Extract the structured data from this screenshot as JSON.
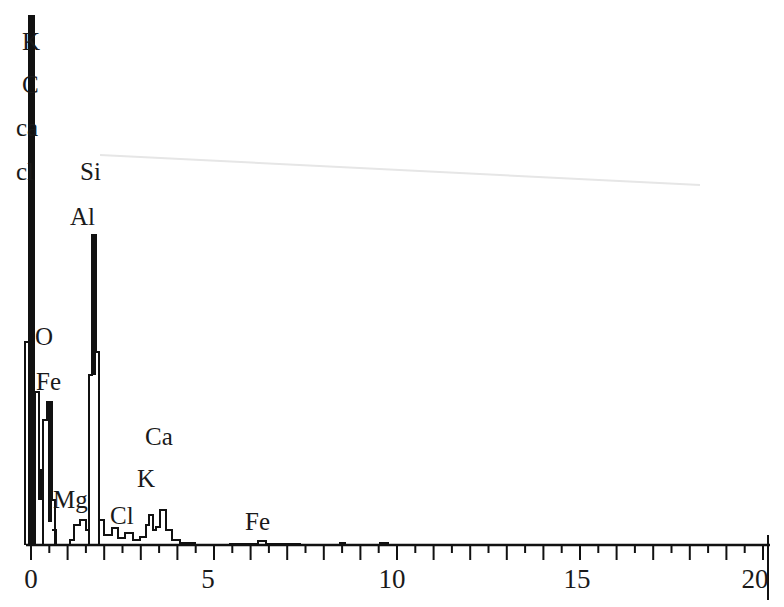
{
  "chart_data": {
    "type": "line",
    "title": "",
    "xlabel": "",
    "ylabel": "",
    "xlim": [
      0,
      20
    ],
    "x_ticks": [
      "0",
      "5",
      "10",
      "15",
      "20"
    ],
    "minor_tick_step": 0.5,
    "grid": false,
    "legend": null,
    "series": [
      {
        "name": "EDS spectrum",
        "x": [
          0.0,
          0.05,
          0.1,
          0.2,
          0.3,
          0.4,
          0.5,
          0.55,
          0.6,
          0.7,
          0.8,
          0.9,
          1.0,
          1.1,
          1.2,
          1.25,
          1.3,
          1.4,
          1.5,
          1.6,
          1.65,
          1.7,
          1.74,
          1.8,
          1.85,
          1.9,
          2.0,
          2.1,
          2.2,
          2.3,
          2.4,
          2.5,
          2.6,
          2.7,
          2.8,
          2.9,
          3.0,
          3.1,
          3.2,
          3.3,
          3.35,
          3.4,
          3.5,
          3.6,
          3.7,
          3.75,
          3.8,
          3.9,
          4.0,
          4.2,
          4.5,
          5.0,
          5.5,
          6.0,
          6.4,
          6.6,
          7.0,
          7.5,
          8.0,
          9.0,
          9.7,
          10.0,
          12.0,
          15.0,
          20.0
        ],
        "values": [
          38,
          100,
          36,
          14,
          8,
          22,
          28,
          30,
          8,
          3,
          3,
          4,
          3,
          3,
          6,
          6,
          4,
          6,
          4,
          48,
          52,
          58,
          60,
          36,
          30,
          8,
          3,
          3,
          2,
          3,
          2,
          2,
          3,
          1,
          2,
          2,
          2,
          1,
          3,
          7,
          8,
          5,
          3,
          4,
          7,
          8,
          5,
          3,
          2,
          1,
          1,
          0.6,
          0.5,
          0.5,
          0.8,
          0.5,
          0.4,
          0.4,
          0.3,
          0.2,
          0.4,
          0.2,
          0.1,
          0.1,
          0.1
        ]
      }
    ],
    "annotations": [
      {
        "text": "K",
        "x": 0.0,
        "y": 95
      },
      {
        "text": "C",
        "x": 0.0,
        "y": 86
      },
      {
        "text": "ca",
        "x": -0.2,
        "y": 78
      },
      {
        "text": "cl",
        "x": -0.2,
        "y": 70
      },
      {
        "text": "Si",
        "x": 1.75,
        "y": 70
      },
      {
        "text": "Al",
        "x": 1.6,
        "y": 63
      },
      {
        "text": "O",
        "x": 0.4,
        "y": 40
      },
      {
        "text": "Fe",
        "x": 0.4,
        "y": 31
      },
      {
        "text": "Ca",
        "x": 3.8,
        "y": 20
      },
      {
        "text": "K",
        "x": 3.3,
        "y": 13
      },
      {
        "text": "Mg",
        "x": 1.1,
        "y": 9
      },
      {
        "text": "Cl",
        "x": 2.5,
        "y": 5
      },
      {
        "text": "Fe",
        "x": 6.4,
        "y": 4
      }
    ]
  },
  "labels": {
    "peak_K_top": "K",
    "peak_C": "C",
    "peak_ca": "ca",
    "peak_cl": "cl",
    "peak_Si": "Si",
    "peak_Al": "Al",
    "peak_O": "O",
    "peak_Fe_low": "Fe",
    "peak_Ca": "Ca",
    "peak_K": "K",
    "peak_Mg": "Mg",
    "peak_Cl": "Cl",
    "peak_Fe_high": "Fe"
  },
  "axis": {
    "tick_0": "0",
    "tick_5": "5",
    "tick_10": "10",
    "tick_15": "15",
    "tick_20": "20"
  }
}
